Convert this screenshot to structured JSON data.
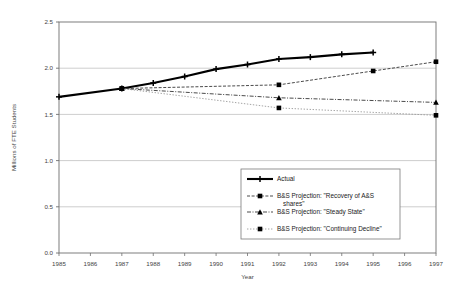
{
  "chart_data": {
    "type": "line",
    "title": "",
    "xlabel": "Year",
    "ylabel": "Millions of FTE Students",
    "x": [
      1985,
      1986,
      1987,
      1988,
      1989,
      1990,
      1991,
      1992,
      1993,
      1994,
      1995,
      1996,
      1997
    ],
    "xlim": [
      1985,
      1997
    ],
    "ylim": [
      0.0,
      2.5
    ],
    "yticks": [
      "0.0",
      "0.5",
      "1.0",
      "1.5",
      "2.0",
      "2.5"
    ],
    "ytick_values": [
      0.0,
      0.5,
      1.0,
      1.5,
      2.0,
      2.5
    ],
    "xticks": [
      "1985",
      "1986",
      "1987",
      "1988",
      "1989",
      "1990",
      "1991",
      "1992",
      "1993",
      "1994",
      "1995",
      "1996",
      "1997"
    ],
    "grid": "horizontal",
    "legend_position": "center",
    "series": [
      {
        "name": "Actual",
        "style": "solid-thick",
        "marker": "plus",
        "x": [
          1985,
          1987,
          1988,
          1989,
          1990,
          1991,
          1992,
          1993,
          1994,
          1995
        ],
        "values": [
          1.69,
          1.78,
          1.84,
          1.91,
          1.99,
          2.04,
          2.1,
          2.12,
          2.15,
          2.17
        ]
      },
      {
        "name": "B&S Projection: \"Recovery of A&S shares\"",
        "style": "dashed",
        "marker": "square",
        "x": [
          1987,
          1992,
          1995,
          1997
        ],
        "values": [
          1.78,
          1.82,
          1.97,
          2.07
        ]
      },
      {
        "name": "B&S Projection: \"Steady State\"",
        "style": "dash-dot",
        "marker": "triangle",
        "x": [
          1987,
          1992,
          1997
        ],
        "values": [
          1.78,
          1.68,
          1.63
        ]
      },
      {
        "name": "B&S Projection: \"Continuing Decline\"",
        "style": "dotted",
        "marker": "square",
        "x": [
          1987,
          1992,
          1997
        ],
        "values": [
          1.78,
          1.57,
          1.49
        ]
      }
    ]
  },
  "legend": {
    "items": [
      {
        "label": "Actual"
      },
      {
        "label": "B&S Projection: \"Recovery of A&S",
        "label2": "shares\""
      },
      {
        "label": "B&S Projection: \"Steady State\""
      },
      {
        "label": "B&S Projection: \"Continuing Decline\""
      }
    ]
  },
  "colors": {
    "actual": "#000000",
    "projection": "#2b2b2b",
    "grid": "#b9b9b9",
    "frame": "#6f6f6f",
    "background": "#ffffff"
  }
}
